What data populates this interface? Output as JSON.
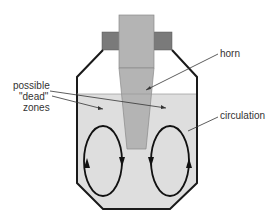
{
  "diagram": {
    "type": "schematic",
    "labels": {
      "horn": "horn",
      "circulation": "circulation",
      "dead_zones_line1": "possible",
      "dead_zones_line2": "\"dead\"",
      "dead_zones_line3": "zones"
    },
    "colors": {
      "liquid": "#dedede",
      "horn": "#b4b4b4",
      "flange": "#7a7a7a",
      "outline": "#1a1a1a",
      "leader": "#333333",
      "text": "#333333"
    },
    "components": [
      "vessel",
      "liquid",
      "horn",
      "flange-left",
      "flange-right",
      "circulation-loop-left",
      "circulation-loop-right"
    ]
  }
}
